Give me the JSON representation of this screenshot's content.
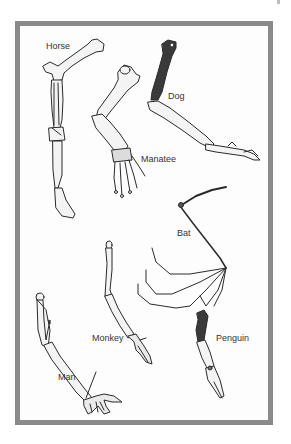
{
  "figure": {
    "labels": {
      "horse": "Horse",
      "dog": "Dog",
      "manatee": "Manatee",
      "bat": "Bat",
      "monkey": "Monkey",
      "man": "Man",
      "penguin": "Penguin"
    },
    "colors": {
      "frame": "#8a8a8a",
      "bone_outline": "#2a2a2a",
      "bone_fill": "#f4f4f4",
      "bone_shade": "#3a3a3a",
      "label_text": "#333333"
    }
  }
}
